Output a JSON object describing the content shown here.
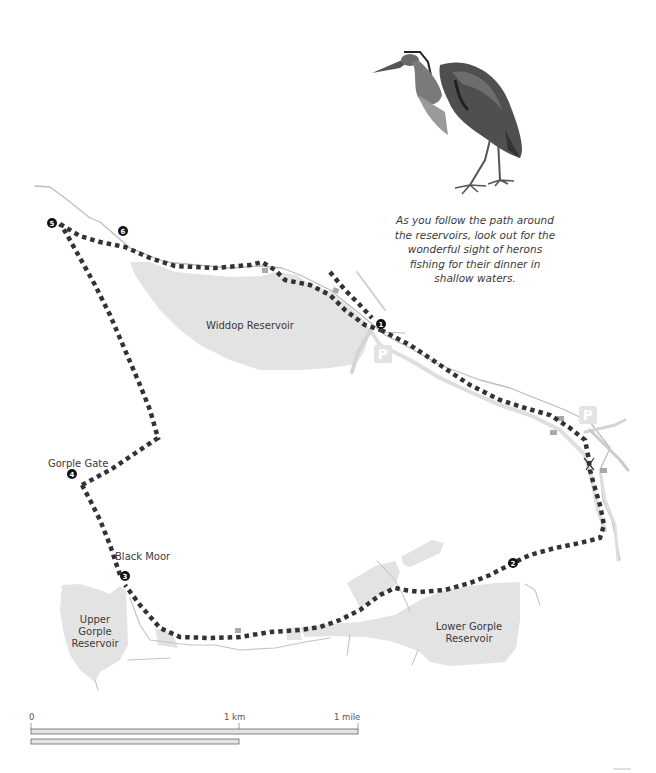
{
  "colors": {
    "water": "#e3e3e3",
    "road": "#dcdcdc",
    "road_outline": "#b8b8b8",
    "route": "#333333",
    "waypoint": "#111111",
    "building": "#a9a9a9",
    "parking": "#e6e6e6",
    "text": "#3a3a3a"
  },
  "caption": {
    "lines": [
      "As you follow the path around",
      "the reservoirs, look out for the",
      "wonderful sight of herons",
      "fishing for their dinner in",
      "shallow waters."
    ]
  },
  "illustration": {
    "icon": "heron-icon"
  },
  "reservoirs": {
    "widdop": "Widdop Reservoir",
    "upper_gorple": [
      "Upper",
      "Gorple",
      "Reservoir"
    ],
    "lower_gorple": [
      "Lower Gorple",
      "Reservoir"
    ]
  },
  "places": {
    "gorple_gate": "Gorple Gate",
    "black_moor": "Black Moor"
  },
  "parking": {
    "label": "P",
    "count": 2
  },
  "waypoints": [
    {
      "num": "1",
      "x": 381,
      "y": 324
    },
    {
      "num": "2",
      "x": 513,
      "y": 563
    },
    {
      "num": "3",
      "x": 125,
      "y": 576
    },
    {
      "num": "4",
      "x": 72,
      "y": 474
    },
    {
      "num": "5",
      "x": 52,
      "y": 223
    },
    {
      "num": "6",
      "x": 123,
      "y": 231
    }
  ],
  "scale_bar": {
    "zero": "0",
    "km": "1 km",
    "mile": "1 mile"
  }
}
